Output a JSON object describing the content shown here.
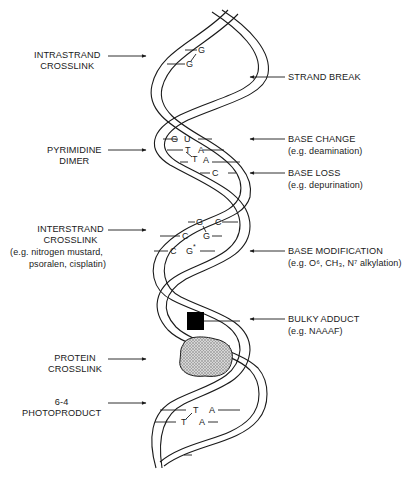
{
  "diagram": {
    "colors": {
      "ink": "#1a1a1a",
      "background": "#ffffff",
      "adduct": "#000000",
      "protein_fill": "#bdbdbd"
    },
    "left_labels": [
      {
        "id": "intrastrand",
        "lines": [
          "INTRASTRAND",
          "CROSSLINK"
        ],
        "sub": ""
      },
      {
        "id": "pyrimidine",
        "lines": [
          "PYRIMIDINE",
          "DIMER"
        ],
        "sub": ""
      },
      {
        "id": "interstrand",
        "lines": [
          "INTERSTRAND",
          "CROSSLINK"
        ],
        "sub": [
          "(e.g. nitrogen mustard,",
          "psoralen, cisplatin)"
        ]
      },
      {
        "id": "protein",
        "lines": [
          "PROTEIN",
          "CROSSLINK"
        ],
        "sub": ""
      },
      {
        "id": "photoproduct",
        "lines": [
          "6-4",
          "PHOTOPRODUCT"
        ],
        "sub": ""
      }
    ],
    "right_labels": [
      {
        "id": "strand_break",
        "title": "STRAND BREAK",
        "sub": ""
      },
      {
        "id": "base_change",
        "title": "BASE CHANGE",
        "sub": "(e.g. deamination)"
      },
      {
        "id": "base_loss",
        "title": "BASE LOSS",
        "sub": "(e.g. depurination)"
      },
      {
        "id": "base_modification",
        "title": "BASE MODIFICATION",
        "sub": "(e.g. O⁶, CH₃, N⁷ alkylation)"
      },
      {
        "id": "bulky_adduct",
        "title": "BULKY ADDUCT",
        "sub": "(e.g. NAAAF)"
      }
    ],
    "bases": {
      "intrastrand": [
        "G",
        "G"
      ],
      "pyrimidine": [
        "G",
        "U",
        "T",
        "A",
        "T",
        "A"
      ],
      "base_loss": [
        "C"
      ],
      "interstrand": [
        "G",
        "C",
        "C",
        "G",
        "C",
        "G*"
      ],
      "photoproduct": [
        "T",
        "A",
        "T",
        "A"
      ]
    }
  }
}
